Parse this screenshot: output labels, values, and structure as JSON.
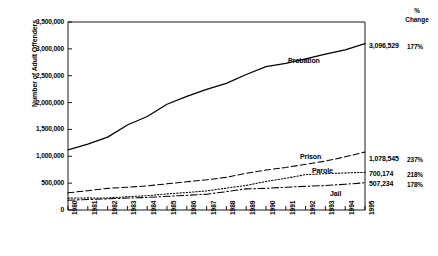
{
  "chart_data": {
    "type": "line",
    "title": "",
    "xlabel": "",
    "ylabel": "Number of Adult Offenders",
    "categories": [
      "1980",
      "1981",
      "1982",
      "1983",
      "1984",
      "1985",
      "1986",
      "1987",
      "1988",
      "1989",
      "1990",
      "1991",
      "1992",
      "1993",
      "1994",
      "1995"
    ],
    "ylim": [
      0,
      3500000
    ],
    "ytick_labels": [
      "0",
      "500,000",
      "1,000,000",
      "1,500,000",
      "2,000,000",
      "2,500,000",
      "3,000,000",
      "3,500,000"
    ],
    "ytick_values": [
      0,
      500000,
      1000000,
      1500000,
      2000000,
      2500000,
      3000000,
      3500000
    ],
    "grid": false,
    "legend_position": "inline-annotations",
    "series": [
      {
        "name": "Probation",
        "style": "solid",
        "end_value_label": "3,096,529",
        "pct_change_label": "177%",
        "values": [
          1118097,
          1225934,
          1357264,
          1582947,
          1740948,
          1968712,
          2114621,
          2247158,
          2356483,
          2522125,
          2670234,
          2728472,
          2811611,
          2903061,
          2981022,
          3096529
        ]
      },
      {
        "name": "Prison",
        "style": "dashed",
        "end_value_label": "1,078,545",
        "pct_change_label": "237%",
        "values": [
          319598,
          360029,
          402914,
          423898,
          448264,
          487593,
          526436,
          562814,
          607766,
          683367,
          743382,
          792535,
          850566,
          909381,
          990147,
          1078545
        ]
      },
      {
        "name": "Parole",
        "style": "dotted",
        "end_value_label": "700,174",
        "pct_change_label": "218%",
        "values": [
          220438,
          225539,
          224604,
          246440,
          266992,
          300203,
          325638,
          355505,
          407977,
          456803,
          531407,
          590442,
          658601,
          676100,
          690371,
          700174
        ]
      },
      {
        "name": "Jail",
        "style": "dashdot",
        "end_value_label": "507,234",
        "pct_change_label": "178%",
        "values": [
          182288,
          195085,
          207853,
          221815,
          233018,
          254986,
          272736,
          294092,
          341893,
          393303,
          403019,
          424129,
          441780,
          455500,
          479800,
          507234
        ]
      }
    ]
  },
  "axes": {
    "y_title": "Number of Adult Offenders"
  },
  "right_column": {
    "header_line1": "%",
    "header_line2": "Change"
  }
}
